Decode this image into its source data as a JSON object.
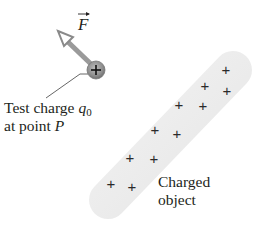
{
  "diagram": {
    "type": "electric-field-test-charge",
    "force_vector": {
      "symbol": "F",
      "has_vector_arrow": true
    },
    "test_charge": {
      "sign": "+",
      "label_line1_prefix": "Test charge ",
      "label_symbol": "q",
      "label_subscript": "0",
      "label_line2_prefix": "at point ",
      "label_point": "P"
    },
    "charged_object": {
      "label_line1": "Charged",
      "label_line2": "object",
      "charges": [
        {
          "sign": "+",
          "x": 226,
          "y": 75
        },
        {
          "sign": "+",
          "x": 205,
          "y": 91
        },
        {
          "sign": "+",
          "x": 227,
          "y": 96
        },
        {
          "sign": "+",
          "x": 179,
          "y": 110
        },
        {
          "sign": "+",
          "x": 203,
          "y": 111
        },
        {
          "sign": "+",
          "x": 155,
          "y": 135
        },
        {
          "sign": "+",
          "x": 177,
          "y": 139
        },
        {
          "sign": "+",
          "x": 130,
          "y": 163
        },
        {
          "sign": "+",
          "x": 154,
          "y": 164
        },
        {
          "sign": "+",
          "x": 111,
          "y": 189
        },
        {
          "sign": "+",
          "x": 132,
          "y": 192
        }
      ]
    },
    "colors": {
      "object_fill": "#ececec",
      "charge_fill": "#8c8c8c",
      "arrow": "#9a9a9a",
      "text": "#231f20"
    }
  }
}
